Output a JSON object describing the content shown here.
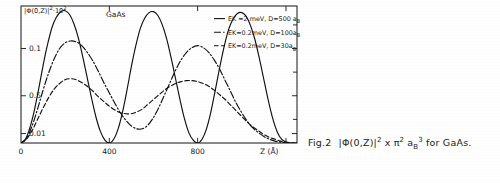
{
  "figure": {
    "caption_prefix": "Fig.2",
    "caption_body": "|Φ(0,Z)|",
    "caption_exp1": "2",
    "caption_mid": "x π",
    "caption_exp2": "2",
    "caption_a": "a",
    "caption_a_sub": "B",
    "caption_a_exp": "3",
    "caption_tail": "for GaAs."
  },
  "plot": {
    "title": "GaAs",
    "ylabel_main": "|Φ(0,Z)|",
    "ylabel_exp": "2",
    "ylabel_factor": "·10",
    "ylabel_factor_exp": "2",
    "xlabel": "Z (Å)",
    "background": "#ffffff",
    "ink": "#101010"
  },
  "chart_data": {
    "type": "line",
    "title": "GaAs",
    "xlabel": "Z (Å)",
    "ylabel": "|Φ(0,Z)|²·10²",
    "xlim": [
      0,
      1250
    ],
    "ylim": [
      0,
      0.145
    ],
    "xticks": [
      0,
      400,
      800,
      1200
    ],
    "xtick_labels": [
      "0",
      "400",
      "800",
      ""
    ],
    "yticks": [
      0.01,
      0.05,
      0.1
    ],
    "ytick_labels": [
      "0.01",
      "0.5",
      "0.1"
    ],
    "grid": false,
    "legend_position": "upper-right-inside",
    "series": [
      {
        "name": "EK =2.meV, D=500 a",
        "name_sub": "B",
        "dash_prefix": "—",
        "style": "solid",
        "x": [
          0,
          20,
          40,
          60,
          80,
          100,
          120,
          140,
          160,
          180,
          200,
          220,
          240,
          260,
          280,
          300,
          320,
          340,
          360,
          380,
          400,
          420,
          440,
          460,
          480,
          500,
          520,
          540,
          560,
          580,
          600,
          620,
          640,
          660,
          680,
          700,
          720,
          740,
          760,
          780,
          800,
          820,
          840,
          860,
          880,
          900,
          920,
          940,
          960,
          980,
          1000,
          1020,
          1040,
          1060,
          1080,
          1100,
          1120,
          1140,
          1160,
          1180,
          1200,
          1220,
          1240
        ],
        "y": [
          0.0,
          0.004,
          0.016,
          0.034,
          0.057,
          0.082,
          0.104,
          0.122,
          0.133,
          0.139,
          0.14,
          0.136,
          0.126,
          0.111,
          0.091,
          0.069,
          0.047,
          0.027,
          0.012,
          0.003,
          0.0,
          0.004,
          0.015,
          0.033,
          0.056,
          0.081,
          0.103,
          0.121,
          0.132,
          0.138,
          0.139,
          0.135,
          0.125,
          0.11,
          0.09,
          0.068,
          0.046,
          0.026,
          0.011,
          0.003,
          0.0,
          0.004,
          0.015,
          0.033,
          0.056,
          0.08,
          0.102,
          0.12,
          0.131,
          0.137,
          0.138,
          0.134,
          0.124,
          0.109,
          0.089,
          0.067,
          0.045,
          0.026,
          0.012,
          0.004,
          0.001,
          0.0,
          0.0
        ]
      },
      {
        "name": "EK=0.2meV, D=100a",
        "name_sub": "B",
        "dash_prefix": "–·–",
        "style": "dashdot",
        "x": [
          0,
          25,
          50,
          75,
          100,
          125,
          150,
          175,
          200,
          225,
          250,
          275,
          300,
          325,
          350,
          375,
          400,
          425,
          450,
          475,
          500,
          525,
          550,
          575,
          600,
          625,
          650,
          675,
          700,
          725,
          750,
          775,
          800,
          825,
          850,
          875,
          900,
          925,
          950,
          975,
          1000,
          1025,
          1050,
          1075,
          1100,
          1125,
          1150,
          1175,
          1200,
          1225,
          1250
        ],
        "y": [
          0.0,
          0.005,
          0.018,
          0.036,
          0.056,
          0.074,
          0.089,
          0.1,
          0.106,
          0.108,
          0.107,
          0.103,
          0.096,
          0.087,
          0.076,
          0.064,
          0.053,
          0.042,
          0.032,
          0.024,
          0.018,
          0.015,
          0.015,
          0.019,
          0.027,
          0.038,
          0.051,
          0.064,
          0.077,
          0.088,
          0.096,
          0.101,
          0.103,
          0.101,
          0.096,
          0.088,
          0.078,
          0.066,
          0.054,
          0.042,
          0.032,
          0.023,
          0.016,
          0.011,
          0.007,
          0.004,
          0.002,
          0.001,
          0.0,
          0.0,
          0.0
        ]
      },
      {
        "name": "EK=0.2meV, D=30a",
        "name_sub": "B",
        "dash_prefix": "–––",
        "style": "dashed",
        "x": [
          0,
          25,
          50,
          75,
          100,
          125,
          150,
          175,
          200,
          225,
          250,
          275,
          300,
          325,
          350,
          375,
          400,
          425,
          450,
          475,
          500,
          525,
          550,
          575,
          600,
          625,
          650,
          675,
          700,
          725,
          750,
          775,
          800,
          825,
          850,
          875,
          900,
          925,
          950,
          975,
          1000,
          1025,
          1050,
          1075,
          1100,
          1125,
          1150,
          1175,
          1200,
          1225,
          1250
        ],
        "y": [
          0.0,
          0.004,
          0.013,
          0.025,
          0.037,
          0.048,
          0.057,
          0.063,
          0.067,
          0.068,
          0.067,
          0.064,
          0.06,
          0.055,
          0.049,
          0.044,
          0.039,
          0.035,
          0.032,
          0.031,
          0.031,
          0.033,
          0.036,
          0.041,
          0.046,
          0.051,
          0.056,
          0.06,
          0.063,
          0.065,
          0.066,
          0.066,
          0.065,
          0.063,
          0.06,
          0.056,
          0.051,
          0.046,
          0.04,
          0.034,
          0.028,
          0.022,
          0.017,
          0.013,
          0.009,
          0.006,
          0.004,
          0.002,
          0.001,
          0.0,
          0.0
        ]
      }
    ]
  }
}
